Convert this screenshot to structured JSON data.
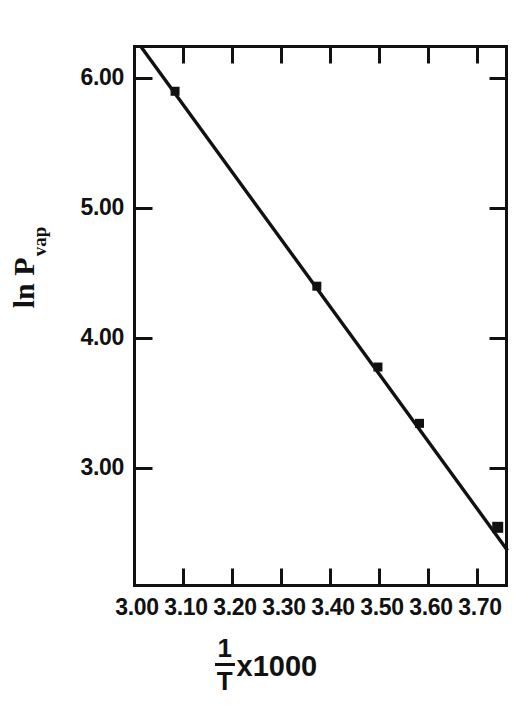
{
  "chart_data": {
    "type": "scatter",
    "title": "",
    "subtitle": "",
    "xlabel": "1/T x1000",
    "xlabel_parts": {
      "numerator": "1",
      "denominator": "T",
      "multiplier": "x1000"
    },
    "ylabel": "ln P",
    "ylabel_subscript": "vap",
    "xlim": [
      3.0,
      3.765
    ],
    "ylim": [
      2.55,
      6.29
    ],
    "xticks": [
      3.0,
      3.1,
      3.2,
      3.3,
      3.4,
      3.5,
      3.6,
      3.7
    ],
    "xticklabels": [
      "3.00",
      "3.10",
      "3.20",
      "3.30",
      "3.40",
      "3.50",
      "3.60",
      "3.70"
    ],
    "yticks": [
      3.0,
      4.0,
      5.0,
      6.0
    ],
    "yticklabels": [
      "3.00",
      "4.00",
      "5.00",
      "6.00"
    ],
    "grid": false,
    "legend": null,
    "tick_direction": "in",
    "frame": "box",
    "series": [
      {
        "name": "ln Pvap data",
        "marker": "filled-square",
        "color": "#111111",
        "x": [
          3.085,
          3.375,
          3.5,
          3.585,
          3.745
        ],
        "y": [
          5.98,
          4.63,
          4.07,
          3.68,
          2.96
        ]
      },
      {
        "name": "least-squares fit line",
        "type": "line",
        "color": "#111111",
        "x": [
          3.015,
          3.765
        ],
        "y": [
          6.29,
          2.8
        ]
      }
    ],
    "annotations": []
  },
  "axes": {
    "y_tick_labels": [
      "6.00",
      "5.00",
      "4.00",
      "3.00"
    ],
    "x_tick_labels": [
      "3.00",
      "3.10",
      "3.20",
      "3.30",
      "3.40",
      "3.50",
      "3.60",
      "3.70"
    ],
    "y_title_main": "ln P",
    "y_title_sub": "vap",
    "x_title_numerator": "1",
    "x_title_denominator": "T",
    "x_title_multiplier": "x1000"
  },
  "colors": {
    "ink": "#111111",
    "background": "#ffffff"
  }
}
